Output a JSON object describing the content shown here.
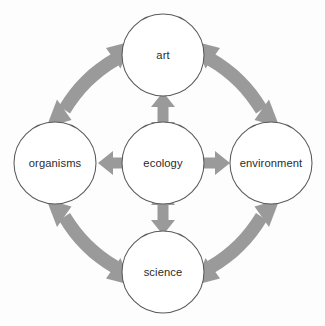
{
  "diagram": {
    "background_color": "#fdfdfd",
    "arrow_color": "#9a9a9a",
    "node_stroke_color": "#5a5a5a",
    "node_fill_color": "#ffffff",
    "label_color": "#2b2b2b",
    "nodes": [
      {
        "id": "art",
        "label": "art",
        "cx": 163,
        "cy": 55,
        "r": 41,
        "position": "top"
      },
      {
        "id": "organisms",
        "label": "organisms",
        "cx": 55,
        "cy": 163,
        "r": 41,
        "position": "left"
      },
      {
        "id": "ecology",
        "label": "ecology",
        "cx": 163,
        "cy": 163,
        "r": 41,
        "position": "center"
      },
      {
        "id": "environment",
        "label": "environment",
        "cx": 271,
        "cy": 163,
        "r": 41,
        "position": "right"
      },
      {
        "id": "science",
        "label": "science",
        "cx": 163,
        "cy": 272,
        "r": 41,
        "position": "bottom"
      }
    ],
    "straight_connectors": [
      {
        "id": "ecology-art",
        "from": "ecology",
        "to": "art",
        "style": "double-headed",
        "orientation": "vertical"
      },
      {
        "id": "ecology-organisms",
        "from": "ecology",
        "to": "organisms",
        "style": "double-headed",
        "orientation": "horizontal"
      },
      {
        "id": "ecology-environment",
        "from": "ecology",
        "to": "environment",
        "style": "double-headed",
        "orientation": "horizontal"
      },
      {
        "id": "ecology-science",
        "from": "ecology",
        "to": "science",
        "style": "double-headed",
        "orientation": "vertical"
      }
    ],
    "curved_connectors": [
      {
        "id": "art-organisms",
        "from": "art",
        "to": "organisms",
        "style": "double-headed",
        "quadrant": "top-left"
      },
      {
        "id": "art-environment",
        "from": "art",
        "to": "environment",
        "style": "double-headed",
        "quadrant": "top-right"
      },
      {
        "id": "organisms-science",
        "from": "organisms",
        "to": "science",
        "style": "double-headed",
        "quadrant": "bottom-left"
      },
      {
        "id": "environment-science",
        "from": "environment",
        "to": "science",
        "style": "double-headed",
        "quadrant": "bottom-right"
      }
    ]
  }
}
